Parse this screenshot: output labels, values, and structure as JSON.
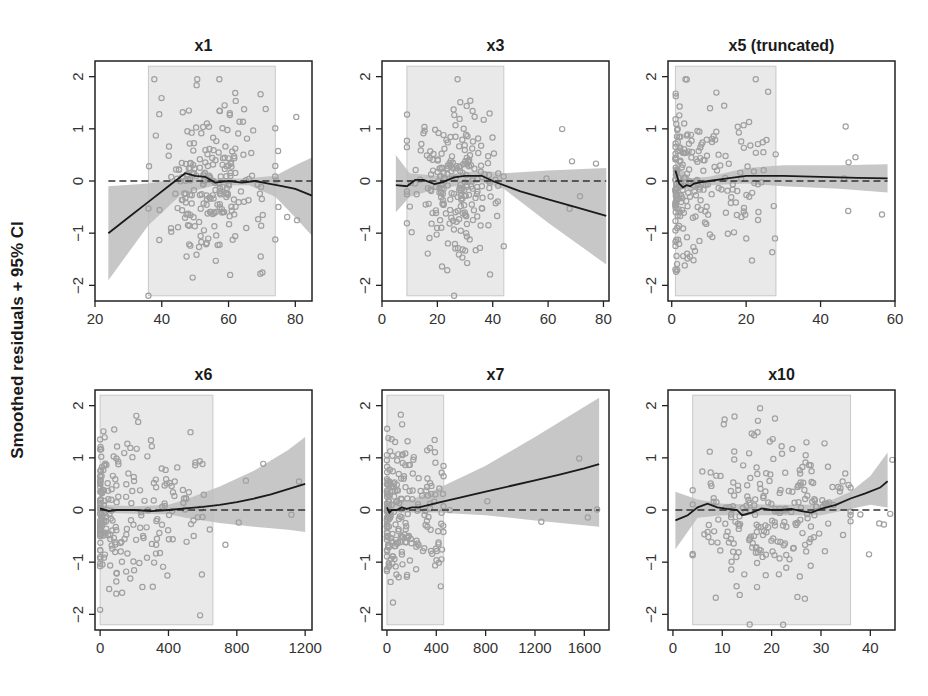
{
  "figure": {
    "ylabel": "Smoothed residuals + 95% CI",
    "colors": {
      "frame": "#222222",
      "shaded_region": "#e9e9e9",
      "shaded_border": "#c8c8c8",
      "ci_band": "#bdbdbd",
      "points": "#a0a0a0",
      "smooth_line": "#1a1a1a",
      "zero_line": "#333333"
    }
  },
  "chart_data": [
    {
      "type": "scatter",
      "title": "x1",
      "xlabel": "",
      "ylabel": "Smoothed residuals + 95% CI",
      "xlim": [
        20,
        85
      ],
      "ylim": [
        -2.3,
        2.3
      ],
      "xticks": [
        20,
        40,
        60,
        80
      ],
      "yticks": [
        -2,
        -1,
        0,
        1,
        2
      ],
      "shaded_x_range": [
        36,
        74
      ],
      "smooth": {
        "x": [
          24,
          30,
          36,
          42,
          47,
          50,
          53,
          56,
          60,
          64,
          68,
          72,
          76,
          80,
          85
        ],
        "y": [
          -1.0,
          -0.7,
          -0.4,
          -0.1,
          0.15,
          0.1,
          0.08,
          -0.03,
          0.0,
          -0.03,
          0.0,
          -0.05,
          -0.1,
          -0.15,
          -0.28
        ]
      },
      "ci_upper": {
        "x": [
          24,
          36,
          46,
          56,
          66,
          74,
          80,
          85
        ],
        "y": [
          -0.1,
          -0.05,
          0.05,
          0.05,
          0.05,
          0.1,
          0.3,
          0.45
        ]
      },
      "ci_lower": {
        "x": [
          24,
          36,
          46,
          56,
          66,
          74,
          80,
          85
        ],
        "y": [
          -1.9,
          -0.85,
          -0.25,
          -0.08,
          -0.08,
          -0.3,
          -0.7,
          -1.05
        ]
      },
      "grid": false,
      "legend": "none"
    },
    {
      "type": "scatter",
      "title": "x3",
      "xlabel": "",
      "ylabel": "",
      "xlim": [
        0,
        82
      ],
      "ylim": [
        -2.3,
        2.3
      ],
      "xticks": [
        0,
        20,
        40,
        60,
        80
      ],
      "yticks": [
        -2,
        -1,
        0,
        1,
        2
      ],
      "shaded_x_range": [
        9,
        44
      ],
      "smooth": {
        "x": [
          5,
          9,
          12,
          15,
          19,
          22,
          26,
          30,
          36,
          40,
          50,
          60,
          70,
          81
        ],
        "y": [
          -0.08,
          -0.1,
          0.02,
          0.02,
          -0.06,
          -0.02,
          0.07,
          0.1,
          0.1,
          0.0,
          -0.2,
          -0.35,
          -0.5,
          -0.67
        ]
      },
      "ci_upper": {
        "x": [
          5,
          10,
          20,
          36,
          44,
          60,
          81
        ],
        "y": [
          0.5,
          0.15,
          0.1,
          0.2,
          0.15,
          0.2,
          0.25
        ]
      },
      "ci_lower": {
        "x": [
          5,
          10,
          20,
          36,
          44,
          60,
          81
        ],
        "y": [
          -0.6,
          -0.3,
          -0.15,
          -0.03,
          -0.15,
          -0.8,
          -1.6
        ]
      },
      "grid": false,
      "legend": "none"
    },
    {
      "type": "scatter",
      "title": "x5 (truncated)",
      "xlabel": "",
      "ylabel": "",
      "xlim": [
        -1,
        60
      ],
      "ylim": [
        -2.3,
        2.3
      ],
      "xticks": [
        0,
        20,
        40,
        60
      ],
      "yticks": [
        -2,
        -1,
        0,
        1,
        2
      ],
      "shaded_x_range": [
        1,
        28
      ],
      "smooth": {
        "x": [
          1,
          2,
          3,
          4,
          5,
          6,
          8,
          10,
          15,
          20,
          30,
          40,
          50,
          58
        ],
        "y": [
          0.2,
          -0.05,
          -0.12,
          -0.08,
          -0.1,
          -0.05,
          -0.02,
          0.0,
          0.05,
          0.1,
          0.1,
          0.08,
          0.06,
          0.05
        ]
      },
      "ci_upper": {
        "x": [
          1,
          5,
          10,
          20,
          30,
          45,
          58
        ],
        "y": [
          0.35,
          0.05,
          0.08,
          0.25,
          0.3,
          0.3,
          0.32
        ]
      },
      "ci_lower": {
        "x": [
          1,
          5,
          10,
          20,
          30,
          45,
          58
        ],
        "y": [
          0.0,
          -0.2,
          -0.08,
          -0.05,
          -0.1,
          -0.15,
          -0.22
        ]
      },
      "grid": false,
      "legend": "none"
    },
    {
      "type": "scatter",
      "title": "x6",
      "xlabel": "",
      "ylabel": "",
      "xlim": [
        -30,
        1240
      ],
      "ylim": [
        -2.3,
        2.3
      ],
      "xticks": [
        0,
        400,
        800,
        1200
      ],
      "yticks": [
        -2,
        -1,
        0,
        1,
        2
      ],
      "shaded_x_range": [
        0,
        660
      ],
      "smooth": {
        "x": [
          0,
          50,
          100,
          200,
          300,
          400,
          500,
          600,
          700,
          800,
          900,
          1000,
          1100,
          1200
        ],
        "y": [
          0.03,
          -0.02,
          0.0,
          0.0,
          -0.02,
          0.0,
          0.03,
          0.06,
          0.1,
          0.15,
          0.22,
          0.3,
          0.4,
          0.5
        ]
      },
      "ci_upper": {
        "x": [
          0,
          200,
          400,
          500,
          700,
          900,
          1100,
          1200
        ],
        "y": [
          0.1,
          0.07,
          0.1,
          0.2,
          0.45,
          0.75,
          1.15,
          1.4
        ]
      },
      "ci_lower": {
        "x": [
          0,
          200,
          400,
          500,
          700,
          900,
          1100,
          1200
        ],
        "y": [
          -0.05,
          -0.07,
          -0.08,
          -0.15,
          -0.25,
          -0.32,
          -0.38,
          -0.42
        ]
      },
      "grid": false,
      "legend": "none"
    },
    {
      "type": "scatter",
      "title": "x7",
      "xlabel": "",
      "ylabel": "",
      "xlim": [
        -40,
        1800
      ],
      "ylim": [
        -2.3,
        2.3
      ],
      "xticks": [
        0,
        400,
        800,
        1200,
        1600
      ],
      "yticks": [
        -2,
        -1,
        0,
        1,
        2
      ],
      "shaded_x_range": [
        0,
        460
      ],
      "smooth": {
        "x": [
          0,
          20,
          40,
          80,
          120,
          160,
          200,
          260,
          400,
          600,
          800,
          1000,
          1200,
          1400,
          1600,
          1720
        ],
        "y": [
          0.05,
          -0.05,
          0.0,
          0.0,
          0.05,
          0.02,
          0.05,
          0.05,
          0.13,
          0.24,
          0.35,
          0.46,
          0.57,
          0.68,
          0.8,
          0.88
        ]
      },
      "ci_upper": {
        "x": [
          0,
          200,
          400,
          800,
          1200,
          1720
        ],
        "y": [
          0.15,
          0.2,
          0.4,
          0.85,
          1.4,
          2.15
        ]
      },
      "ci_lower": {
        "x": [
          0,
          200,
          400,
          800,
          1200,
          1720
        ],
        "y": [
          -0.05,
          -0.05,
          -0.05,
          -0.1,
          -0.2,
          -0.32
        ]
      },
      "grid": false,
      "legend": "none"
    },
    {
      "type": "scatter",
      "title": "x10",
      "xlabel": "",
      "ylabel": "",
      "xlim": [
        -1,
        45
      ],
      "ylim": [
        -2.3,
        2.3
      ],
      "xticks": [
        0,
        10,
        20,
        30,
        40
      ],
      "yticks": [
        -2,
        -1,
        0,
        1,
        2
      ],
      "shaded_x_range": [
        4,
        36
      ],
      "smooth": {
        "x": [
          0.5,
          3,
          5,
          7,
          9,
          11,
          13,
          14,
          16,
          18,
          20,
          22,
          24,
          26,
          28,
          30,
          33,
          36,
          39,
          42,
          43.5
        ],
        "y": [
          -0.2,
          -0.1,
          0.05,
          0.12,
          0.05,
          0.02,
          0.0,
          -0.1,
          -0.05,
          0.03,
          0.0,
          0.0,
          0.02,
          -0.02,
          -0.05,
          0.02,
          0.1,
          0.22,
          0.32,
          0.43,
          0.55
        ]
      },
      "ci_upper": {
        "x": [
          0.5,
          5,
          10,
          20,
          30,
          36,
          40,
          43.5
        ],
        "y": [
          0.35,
          0.2,
          0.12,
          0.1,
          0.1,
          0.35,
          0.65,
          1.1
        ]
      },
      "ci_lower": {
        "x": [
          0.5,
          5,
          10,
          20,
          30,
          36,
          40,
          43.5
        ],
        "y": [
          -0.75,
          -0.15,
          -0.1,
          -0.1,
          -0.1,
          0.02,
          0.1,
          0.05
        ]
      },
      "grid": false,
      "legend": "none"
    }
  ]
}
